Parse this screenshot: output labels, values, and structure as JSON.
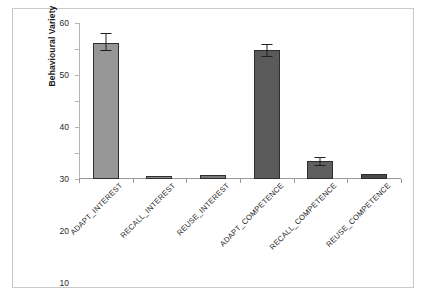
{
  "chart_data": {
    "type": "bar",
    "title": "",
    "xlabel": "",
    "ylabel": "Behavioural Variety",
    "ylim": [
      0,
      60
    ],
    "yticks": [
      0,
      10,
      20,
      30,
      40,
      50,
      60
    ],
    "grid": false,
    "legend": false,
    "categories": [
      "ADAPT_INTEREST",
      "RECALL_INTEREST",
      "REUSE_INTEREST",
      "ADAPT_COMPETENCE",
      "RECALL_COMPETENCE",
      "REUSE_COMPETENCE"
    ],
    "values": [
      52.3,
      1.3,
      1.6,
      49.5,
      6.8,
      2.0
    ],
    "error_upper": [
      3.8,
      0.3,
      0.4,
      2.6,
      1.8,
      0.3
    ],
    "error_lower": [
      3.0,
      0.3,
      0.4,
      2.6,
      1.8,
      0.3
    ],
    "bar_colors": [
      "#969696",
      "#8c8c8c",
      "#7a7a7a",
      "#5a5a5a",
      "#5f5f5f",
      "#4a4a4a"
    ],
    "bar_border_color": "#2e2e2e",
    "error_bar_color": "#1f1f1f",
    "axis_color": "#9a9a9a",
    "frame_color": "#c9c9c9",
    "background": "#ffffff"
  },
  "axis": {
    "y_title": "Behavioural Variety",
    "y_tick_labels": [
      "0",
      "10",
      "20",
      "30",
      "40",
      "50",
      "60"
    ]
  }
}
